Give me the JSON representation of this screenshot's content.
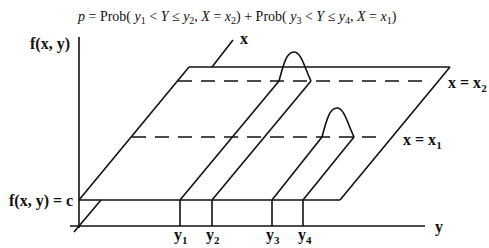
{
  "formula": {
    "p": "p",
    "eq": " = Prob( ",
    "y1": "y",
    "y1_sub": "1",
    "lt1": " < ",
    "Y1": "Y",
    "le1": " ≤ ",
    "y2": "y",
    "y2_sub": "2",
    "comma1": ", ",
    "X1": "X",
    "eq1": " = ",
    "x2": "x",
    "x2_sub": "2",
    "mid": ") + Prob( ",
    "y3": "y",
    "y3_sub": "3",
    "lt2": " < ",
    "Y2": "Y",
    "le2": " ≤ ",
    "y4": "y",
    "y4_sub": "4",
    "comma2": ", ",
    "X2": "X",
    "eq2": " = ",
    "x1": "x",
    "x1_sub": "1",
    "close": ")"
  },
  "axes": {
    "vertical_label": "f(x, y)",
    "x_label": "x",
    "y_label": "y",
    "plane_label": "f(x, y) = c"
  },
  "lines": {
    "x2_label": "x = x",
    "x2_sub": "2",
    "x1_label": "x = x",
    "x1_sub": "1"
  },
  "ticks": [
    {
      "label": "y",
      "sub": "1"
    },
    {
      "label": "y",
      "sub": "2"
    },
    {
      "label": "y",
      "sub": "3"
    },
    {
      "label": "y",
      "sub": "4"
    }
  ]
}
